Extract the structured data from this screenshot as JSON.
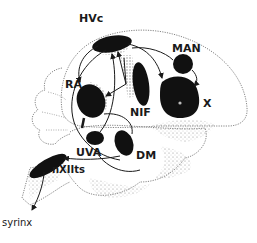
{
  "diagram": {
    "type": "neuroanatomy",
    "colors": {
      "nucleus_fill": "#111111",
      "outline": "#555555",
      "stipple": "#9a9a9a",
      "background": "#ffffff"
    },
    "nuclei": [
      {
        "id": "hvc",
        "label": "HVc"
      },
      {
        "id": "man",
        "label": "MAN"
      },
      {
        "id": "ra",
        "label": "RA"
      },
      {
        "id": "nif",
        "label": "NIF"
      },
      {
        "id": "x",
        "label": "X"
      },
      {
        "id": "uva",
        "label": "UVA"
      },
      {
        "id": "dm",
        "label": "DM"
      },
      {
        "id": "nxiits",
        "label": "nXIIts"
      }
    ],
    "output": {
      "label": "syrinx"
    },
    "connections": [
      {
        "from": "HVc",
        "to": "RA"
      },
      {
        "from": "HVc",
        "to": "X"
      },
      {
        "from": "NIF",
        "to": "HVc"
      },
      {
        "from": "MAN",
        "to": "X"
      },
      {
        "from": "HVc",
        "to": "MAN"
      },
      {
        "from": "RA",
        "to": "DM"
      },
      {
        "from": "RA",
        "to": "nXIIts"
      },
      {
        "from": "UVA",
        "to": "HVc"
      },
      {
        "from": "DM",
        "to": "nXIIts"
      },
      {
        "from": "nXIIts",
        "to": "syrinx"
      }
    ]
  }
}
